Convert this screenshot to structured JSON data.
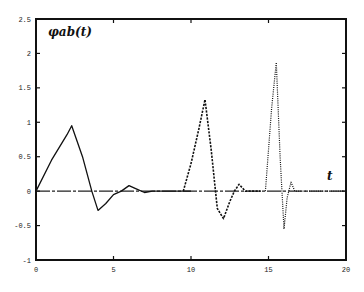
{
  "chart_data": {
    "type": "line",
    "title": "",
    "ylabel_annotation": "φab(t)",
    "xlabel_annotation": "t",
    "xlim": [
      0,
      20
    ],
    "ylim": [
      -1,
      2.5
    ],
    "xticks": [
      0,
      5,
      10,
      15,
      20
    ],
    "xtick_labels": [
      "0",
      "5",
      "10",
      "15",
      "20"
    ],
    "yticks": [
      -1,
      -0.5,
      0,
      0.5,
      1,
      1.5,
      2,
      2.5
    ],
    "ytick_labels": [
      "-1",
      "-0.5",
      "0",
      "0.5",
      "1",
      "1.5",
      "2",
      "2.5"
    ],
    "grid": false,
    "zero_line": true,
    "series": [
      {
        "name": "solid",
        "style": "solid",
        "x": [
          0,
          1,
          2,
          2.3,
          3,
          3.6,
          4,
          4.5,
          5,
          5.5,
          6,
          6.5,
          7,
          7.5,
          10
        ],
        "y": [
          0,
          0.45,
          0.82,
          0.95,
          0.5,
          0.0,
          -0.28,
          -0.18,
          -0.05,
          0.0,
          0.08,
          0.03,
          -0.02,
          0.0,
          0.0
        ]
      },
      {
        "name": "dashed",
        "style": "dashed",
        "x": [
          9.5,
          10,
          10.5,
          10.9,
          11.3,
          11.7,
          12.1,
          12.5,
          12.8,
          13.1,
          13.5,
          14.5
        ],
        "y": [
          0.0,
          0.4,
          0.9,
          1.33,
          0.6,
          -0.25,
          -0.4,
          -0.15,
          0.0,
          0.1,
          0.0,
          0.0
        ]
      },
      {
        "name": "dotted",
        "style": "dotted",
        "x": [
          14.8,
          15.2,
          15.5,
          15.75,
          16.0,
          16.2,
          16.45,
          16.7,
          17.0,
          20
        ],
        "y": [
          0.0,
          1.2,
          1.87,
          0.5,
          -0.55,
          -0.1,
          0.13,
          0.0,
          0.0,
          0.0
        ]
      }
    ]
  }
}
